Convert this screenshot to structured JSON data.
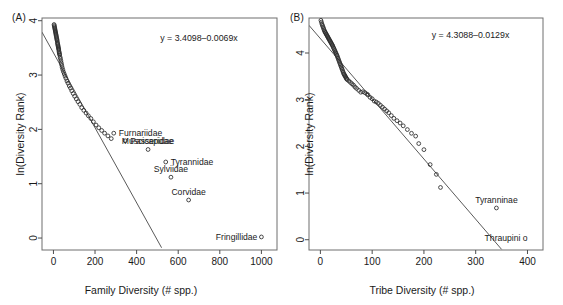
{
  "figure": {
    "panels": [
      {
        "tag": "(A)",
        "equation": "y = 3.4098–0.0069x",
        "xlabel": "Family Diversity (# spp.)",
        "ylabel": "ln(Diversity Rank)"
      },
      {
        "tag": "(B)",
        "equation": "y = 4.3088–0.0129x",
        "xlabel": "Tribe Diversity (# spp.)",
        "ylabel": "ln(Diversity Rank)"
      }
    ]
  },
  "chart_data": [
    {
      "type": "scatter",
      "title": "(A)",
      "xlabel": "Family Diversity (# spp.)",
      "ylabel": "ln(Diversity Rank)",
      "xlim": [
        -55,
        1075
      ],
      "ylim": [
        -0.22,
        4.05
      ],
      "xticks": [
        0,
        200,
        400,
        600,
        800,
        1000
      ],
      "yticks": [
        0,
        1,
        2,
        3,
        4
      ],
      "grid": false,
      "legend": null,
      "annotations": [
        {
          "text": "y = 3.4098–0.0069x",
          "x": 700,
          "y": 3.62
        }
      ],
      "fit": {
        "equation": "y = 3.4098–0.0069x",
        "intercept": 3.4098,
        "slope": -0.0069,
        "x_range": [
          -55,
          520
        ]
      },
      "labeled_points": [
        {
          "label": "Furnariidae",
          "x": 290,
          "y": 1.93
        },
        {
          "label": "Passeridae",
          "x": 345,
          "y": 1.79
        },
        {
          "label": "Muscicapidae",
          "x": 455,
          "y": 1.63
        },
        {
          "label": "Tyrannidae",
          "x": 540,
          "y": 1.4
        },
        {
          "label": "Sylviidae",
          "x": 565,
          "y": 1.12
        },
        {
          "label": "Corvidae",
          "x": 650,
          "y": 0.7
        },
        {
          "label": "Fringillidae",
          "x": 1000,
          "y": 0.02
        }
      ],
      "x": [
        3,
        4,
        5,
        6,
        7,
        8,
        9,
        10,
        11,
        12,
        13,
        14,
        15,
        16,
        17,
        18,
        19,
        20,
        21,
        22,
        23,
        24,
        25,
        26,
        27,
        28,
        29,
        30,
        32,
        34,
        36,
        38,
        40,
        42,
        45,
        48,
        52,
        56,
        60,
        65,
        70,
        76,
        82,
        88,
        95,
        102,
        110,
        118,
        127,
        136,
        146,
        157,
        168,
        180,
        192,
        205,
        218,
        232,
        246,
        262,
        278,
        290,
        345,
        455,
        540,
        565,
        650,
        1000
      ],
      "y": [
        3.93,
        3.91,
        3.89,
        3.87,
        3.85,
        3.83,
        3.81,
        3.79,
        3.77,
        3.75,
        3.73,
        3.71,
        3.69,
        3.67,
        3.65,
        3.63,
        3.6,
        3.58,
        3.56,
        3.54,
        3.52,
        3.5,
        3.48,
        3.46,
        3.43,
        3.41,
        3.39,
        3.37,
        3.33,
        3.3,
        3.26,
        3.22,
        3.18,
        3.14,
        3.1,
        3.06,
        3.02,
        2.98,
        2.94,
        2.89,
        2.85,
        2.8,
        2.76,
        2.71,
        2.66,
        2.61,
        2.56,
        2.51,
        2.46,
        2.4,
        2.35,
        2.3,
        2.25,
        2.2,
        2.14,
        2.08,
        2.03,
        1.98,
        1.93,
        1.88,
        1.83,
        1.93,
        1.79,
        1.63,
        1.4,
        1.12,
        0.7,
        0.02
      ]
    },
    {
      "type": "scatter",
      "title": "(B)",
      "xlabel": "Tribe Diversity (# spp.)",
      "ylabel": "ln(Diversity Rank)",
      "xlim": [
        -22,
        430
      ],
      "ylim": [
        -0.22,
        4.75
      ],
      "xticks": [
        0,
        100,
        200,
        300,
        400
      ],
      "yticks": [
        0,
        1,
        2,
        3,
        4
      ],
      "grid": false,
      "legend": null,
      "annotations": [
        {
          "text": "y = 4.3088–0.0129x",
          "x": 290,
          "y": 4.32
        }
      ],
      "fit": {
        "equation": "y = 4.3088–0.0129x",
        "intercept": 4.3088,
        "slope": -0.0129,
        "x_range": [
          -22,
          350
        ]
      },
      "labeled_points": [
        {
          "label": "Tyranninae",
          "x": 340,
          "y": 0.68
        },
        {
          "label": "Thraupini o",
          "x": 408,
          "y": 0.04
        }
      ],
      "x": [
        1,
        2,
        3,
        4,
        5,
        6,
        7,
        8,
        9,
        10,
        11,
        12,
        13,
        14,
        15,
        16,
        17,
        18,
        19,
        20,
        21,
        22,
        23,
        24,
        25,
        26,
        27,
        28,
        29,
        30,
        31,
        32,
        33,
        34,
        35,
        36,
        37,
        38,
        39,
        40,
        41,
        42,
        43,
        44,
        45,
        46,
        47,
        48,
        49,
        50,
        51,
        52,
        55,
        58,
        61,
        64,
        67,
        70,
        74,
        78,
        82,
        86,
        90,
        92,
        96,
        100,
        104,
        108,
        112,
        116,
        120,
        124,
        128,
        132,
        137,
        142,
        148,
        154,
        160,
        168,
        176,
        184,
        190,
        200,
        212,
        224,
        232,
        340
      ],
      "y": [
        4.7,
        4.66,
        4.62,
        4.59,
        4.56,
        4.53,
        4.5,
        4.47,
        4.45,
        4.43,
        4.41,
        4.39,
        4.37,
        4.35,
        4.33,
        4.31,
        4.29,
        4.27,
        4.25,
        4.23,
        4.21,
        4.19,
        4.17,
        4.15,
        4.12,
        4.1,
        4.07,
        4.05,
        4.02,
        4.0,
        3.97,
        3.95,
        3.92,
        3.89,
        3.86,
        3.83,
        3.8,
        3.77,
        3.74,
        3.71,
        3.68,
        3.65,
        3.62,
        3.59,
        3.56,
        3.54,
        3.52,
        3.5,
        3.48,
        3.46,
        3.44,
        3.43,
        3.4,
        3.37,
        3.34,
        3.31,
        3.27,
        3.24,
        3.2,
        3.16,
        3.17,
        3.15,
        3.12,
        3.1,
        3.05,
        3.02,
        2.97,
        2.95,
        2.92,
        2.88,
        2.84,
        2.8,
        2.76,
        2.72,
        2.66,
        2.6,
        2.55,
        2.5,
        2.44,
        2.36,
        2.28,
        2.22,
        2.06,
        1.93,
        1.61,
        1.4,
        1.12,
        0.68
      ]
    }
  ]
}
